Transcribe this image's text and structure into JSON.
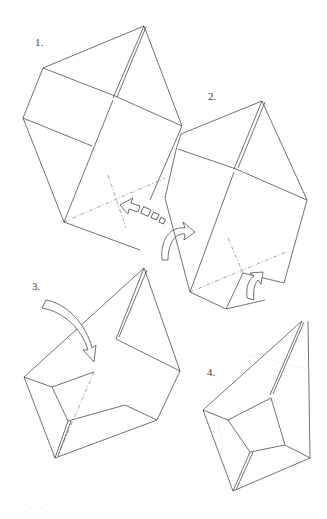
{
  "diagram": {
    "type": "instructional folding diagram",
    "steps": [
      {
        "label": "1.",
        "description": "square sheet folded along diagonal creases, with inward-pointing arrows"
      },
      {
        "label": "2.",
        "description": "flap tucked with curved arrows showing folding direction"
      },
      {
        "label": "3.",
        "description": "curved arrow showing top flap folded down into box shape"
      },
      {
        "label": "4.",
        "description": "finished kite/box form"
      }
    ]
  },
  "caption": "· · ·"
}
